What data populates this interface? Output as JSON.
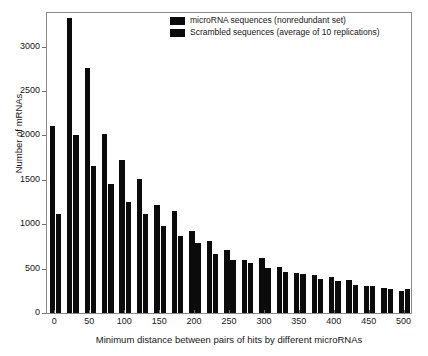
{
  "chart_data": {
    "type": "bar",
    "title": "",
    "xlabel": "Minimum distance between pairs of hits by different microRNAs",
    "ylabel": "Number of mRNAs",
    "xlim": [
      -12,
      512
    ],
    "ylim": [
      0,
      3400
    ],
    "grid": false,
    "legend_position": "top-right",
    "xticks": [
      0,
      50,
      100,
      150,
      200,
      250,
      300,
      350,
      400,
      450,
      500
    ],
    "yticks": [
      0,
      500,
      1000,
      1500,
      2000,
      2500,
      3000
    ],
    "bin_width": 25,
    "categories": [
      0,
      25,
      50,
      75,
      100,
      125,
      150,
      175,
      200,
      225,
      250,
      275,
      300,
      325,
      350,
      375,
      400,
      425,
      450,
      475,
      500
    ],
    "series": [
      {
        "name": "microRNA sequences (nonredundant set)",
        "color": "#0b0b0b",
        "values": [
          2100,
          3320,
          2755,
          2020,
          1720,
          1510,
          1215,
          1150,
          925,
          815,
          705,
          600,
          615,
          520,
          450,
          430,
          410,
          375,
          300,
          280,
          250
        ]
      },
      {
        "name": "Scrambled sequences (average of 10 replications)",
        "color": "#0b0b0b",
        "values": [
          1110,
          2000,
          1660,
          1455,
          1255,
          1110,
          980,
          865,
          790,
          660,
          600,
          560,
          510,
          465,
          440,
          385,
          360,
          320,
          305,
          275,
          270
        ]
      }
    ]
  },
  "legend": {
    "entries": [
      {
        "label": "microRNA sequences (nonredundant set)"
      },
      {
        "label": "Scrambled sequences (average of 10 replications)"
      }
    ]
  },
  "axes": {
    "y_title": "Number of mRNAs",
    "x_title": "Minimum distance between pairs of hits by different microRNAs",
    "y_tick_labels": [
      "0",
      "500",
      "1000",
      "1500",
      "2000",
      "2500",
      "3000"
    ],
    "x_tick_labels": [
      "0",
      "50",
      "100",
      "150",
      "200",
      "250",
      "300",
      "350",
      "400",
      "450",
      "500"
    ]
  }
}
